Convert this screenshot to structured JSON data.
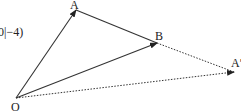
{
  "diagram": {
    "coordinate_fragment": "0|−4)",
    "points": {
      "O": {
        "label": "O",
        "x": 16,
        "y": 98
      },
      "A": {
        "label": "A",
        "x": 76,
        "y": 10
      },
      "B": {
        "label": "B",
        "x": 157,
        "y": 43
      },
      "A_prime": {
        "label": "A′",
        "x": 234,
        "y": 72
      }
    },
    "edges": [
      {
        "from": "O",
        "to": "A",
        "style": "solid",
        "arrow": true
      },
      {
        "from": "A",
        "to": "B",
        "style": "solid",
        "arrow": false
      },
      {
        "from": "O",
        "to": "B",
        "style": "solid",
        "arrow": true
      },
      {
        "from": "B",
        "to": "A_prime",
        "style": "dotted",
        "arrow": false
      },
      {
        "from": "O",
        "to": "A_prime",
        "style": "dotted",
        "arrow": true
      }
    ],
    "colors": {
      "line": "#333333",
      "background": "#ffffff"
    }
  }
}
